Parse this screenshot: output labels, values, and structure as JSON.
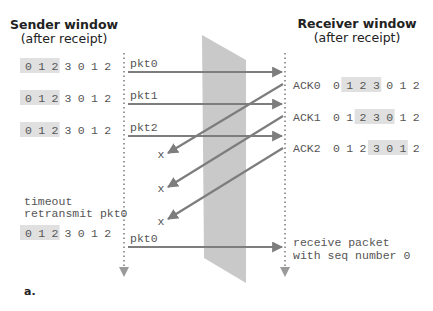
{
  "figure": {
    "label": "a.",
    "sender": {
      "title_line1": "Sender window",
      "title_line2": "(after receipt)",
      "windows": [
        {
          "seq": [
            "0",
            "1",
            "2",
            "3",
            "0",
            "1",
            "2"
          ],
          "window_start": 0,
          "window_size": 3
        },
        {
          "seq": [
            "0",
            "1",
            "2",
            "3",
            "0",
            "1",
            "2"
          ],
          "window_start": 0,
          "window_size": 3
        },
        {
          "seq": [
            "0",
            "1",
            "2",
            "3",
            "0",
            "1",
            "2"
          ],
          "window_start": 0,
          "window_size": 3
        },
        {
          "seq": [
            "0",
            "1",
            "2",
            "3",
            "0",
            "1",
            "2"
          ],
          "window_start": 0,
          "window_size": 3
        }
      ],
      "timeout_line1": "timeout",
      "timeout_line2": "retransmit pkt0"
    },
    "receiver": {
      "title_line1": "Receiver window",
      "title_line2": "(after receipt)",
      "acks": [
        {
          "label": "ACK0",
          "seq": [
            "0",
            "1",
            "2",
            "3",
            "0",
            "1",
            "2"
          ],
          "window_start": 1,
          "window_size": 3
        },
        {
          "label": "ACK1",
          "seq": [
            "0",
            "1",
            "2",
            "3",
            "0",
            "1",
            "2"
          ],
          "window_start": 2,
          "window_size": 3
        },
        {
          "label": "ACK2",
          "seq": [
            "0",
            "1",
            "2",
            "3",
            "0",
            "1",
            "2"
          ],
          "window_start": 3,
          "window_size": 3
        }
      ],
      "final_line1": "receive packet",
      "final_line2": "with seq number 0"
    },
    "packets": [
      "pkt0",
      "pkt1",
      "pkt2",
      "pkt0"
    ],
    "lost_marker": "x",
    "colors": {
      "arrow": "#7d7d7d",
      "channel": "#c9c9c9",
      "window_shade": "#e0e0e0",
      "timeline": "#9a9a9a",
      "text": "#555555"
    }
  }
}
